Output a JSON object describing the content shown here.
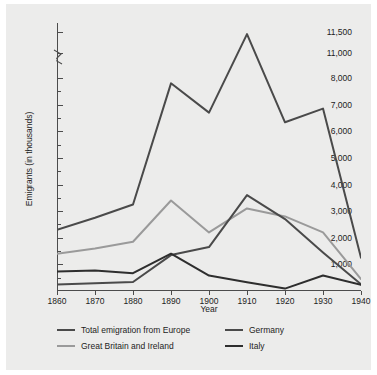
{
  "chart_data": {
    "type": "line",
    "title": "",
    "xlabel": "Year",
    "ylabel": "Emigrants (in thousands)",
    "x": [
      1860,
      1870,
      1880,
      1890,
      1900,
      1910,
      1920,
      1930,
      1940
    ],
    "xtick_labels": [
      "1860",
      "1870",
      "1880",
      "1890",
      "1900",
      "1910",
      "1920",
      "1930",
      "1940"
    ],
    "xlim": [
      1860,
      1940
    ],
    "ytick_labels": [
      "11,500",
      "11,000",
      "8,000",
      "7,000",
      "6,000",
      "5,000",
      "4,000",
      "3,000",
      "2,000",
      "1,000"
    ],
    "ytick_values": [
      11500,
      11000,
      8000,
      7000,
      6000,
      5000,
      4000,
      3000,
      2000,
      1000
    ],
    "yminor_step": 500,
    "ylim": [
      0,
      11500
    ],
    "axis_break": {
      "present": true,
      "between": [
        11000,
        8000
      ],
      "note": "zig-zag break symbol on y-axis"
    },
    "grid": false,
    "legend_position": "below-plot",
    "series": [
      {
        "name": "Total emigration from Europe",
        "color": "#4a4a4a",
        "values": [
          2300,
          2750,
          3250,
          7800,
          6700,
          11450,
          9350,
          6850,
          1250
        ]
      },
      {
        "name": "Great Britain and Ireland",
        "color": "#9a9a9a",
        "values": [
          1400,
          1600,
          1850,
          3400,
          2200,
          3100,
          2800,
          2200,
          450
        ]
      },
      {
        "name": "Germany",
        "color": "#4a4a4a",
        "values": [
          240,
          290,
          340,
          1350,
          1650,
          3600,
          2700,
          1450,
          250
        ]
      },
      {
        "name": "Italy",
        "color": "#2e2e2e",
        "values": [
          730,
          770,
          670,
          1400,
          580,
          330,
          90,
          580,
          230
        ]
      }
    ]
  },
  "legend": {
    "entries": [
      {
        "label": "Total emigration from Europe",
        "color": "#4a4a4a"
      },
      {
        "label": "Germany",
        "color": "#4a4a4a"
      },
      {
        "label": "Great Britain and Ireland",
        "color": "#9a9a9a"
      },
      {
        "label": "Italy",
        "color": "#2e2e2e"
      }
    ]
  }
}
